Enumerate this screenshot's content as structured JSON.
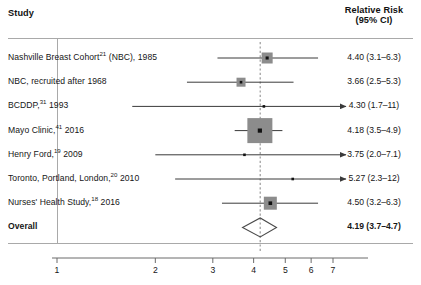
{
  "header": {
    "study_col": "Study",
    "rr_col_line1": "Relative Risk",
    "rr_col_line2": "(95% CI)"
  },
  "chart_data": {
    "type": "forest",
    "title": "",
    "xlabel": "",
    "ylabel": "",
    "x_scale": "log",
    "xlim": [
      1,
      7.8
    ],
    "x_ticks": [
      1,
      2,
      3,
      4,
      5,
      6,
      7
    ],
    "x_tick_labels": [
      "1",
      "2",
      "3",
      "4",
      "5",
      "6",
      "7"
    ],
    "grid": false,
    "legend": "none",
    "reference_line": {
      "value": 4.19,
      "style": "dashed",
      "color": "#9a9a9a"
    },
    "marker_color": "#8c8c8c",
    "center_dot_color": "#111111",
    "line_color": "#3a3a3a",
    "rows": [
      {
        "label": "Nashville Breast Cohort",
        "superscript": "21",
        "label_tail": " (NBC), 1985",
        "rr": 4.4,
        "ci_low": 3.1,
        "ci_high": 6.3,
        "rr_text": "4.40 (3.1–6.3)",
        "marker": "square",
        "marker_size": 11,
        "arrow_right": false,
        "bold": false
      },
      {
        "label": "NBC, recruited after 1968",
        "superscript": "",
        "label_tail": "",
        "rr": 3.66,
        "ci_low": 2.5,
        "ci_high": 5.3,
        "rr_text": "3.66 (2.5–5.3)",
        "marker": "square",
        "marker_size": 9,
        "arrow_right": false,
        "bold": false
      },
      {
        "label": "BCDDP,",
        "superscript": "31",
        "label_tail": " 1993",
        "rr": 4.3,
        "ci_low": 1.7,
        "ci_high": 11,
        "rr_text": "4.30 (1.7–11)",
        "marker": "square",
        "marker_size": 5,
        "arrow_right": true,
        "bold": false
      },
      {
        "label": "Mayo Clinic,",
        "superscript": "41",
        "label_tail": " 2016",
        "rr": 4.18,
        "ci_low": 3.5,
        "ci_high": 4.9,
        "rr_text": "4.18 (3.5–4.9)",
        "marker": "square",
        "marker_size": 25,
        "arrow_right": false,
        "bold": false
      },
      {
        "label": "Henry Ford,",
        "superscript": "19",
        "label_tail": " 2009",
        "rr": 3.75,
        "ci_low": 2.0,
        "ci_high": 7.1,
        "rr_text": "3.75 (2.0–7.1)",
        "marker": "square",
        "marker_size": 5,
        "arrow_right": true,
        "bold": false
      },
      {
        "label": "Toronto, Portland, London,",
        "superscript": "20",
        "label_tail": " 2010",
        "rr": 5.27,
        "ci_low": 2.3,
        "ci_high": 12,
        "rr_text": "5.27 (2.3–12)",
        "marker": "square",
        "marker_size": 5,
        "arrow_right": true,
        "bold": false
      },
      {
        "label": "Nurses' Health Study,",
        "superscript": "18",
        "label_tail": " 2016",
        "rr": 4.5,
        "ci_low": 3.2,
        "ci_high": 6.3,
        "rr_text": "4.50 (3.2–6.3)",
        "marker": "square",
        "marker_size": 13,
        "arrow_right": false,
        "bold": false
      },
      {
        "label": "Overall",
        "superscript": "",
        "label_tail": "",
        "rr": 4.19,
        "ci_low": 3.7,
        "ci_high": 4.7,
        "rr_text": "4.19 (3.7–4.7)",
        "marker": "diamond",
        "marker_size": 0,
        "arrow_right": false,
        "bold": true
      }
    ]
  }
}
